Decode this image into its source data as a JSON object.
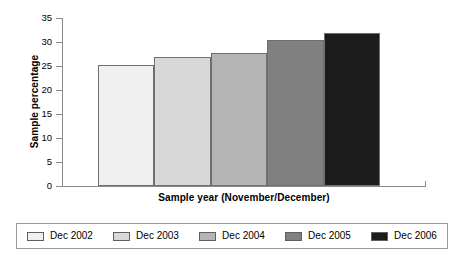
{
  "chart_data": {
    "type": "bar",
    "title": "",
    "xlabel": "Sample year (November/December)",
    "ylabel": "Sample percentage",
    "categories": [
      "Dec 2002",
      "Dec 2003",
      "Dec 2004",
      "Dec 2005",
      "Dec 2006"
    ],
    "values": [
      25.3,
      26.8,
      27.7,
      30.4,
      31.8
    ],
    "ylim": [
      0,
      35
    ],
    "yticks": [
      0,
      5,
      10,
      15,
      20,
      25,
      30,
      35
    ],
    "ytick_labels": [
      "0",
      "5",
      "10",
      "15",
      "20",
      "25",
      "30",
      "35"
    ],
    "xticks": [],
    "grid": false,
    "legend_position": "bottom",
    "bar_colors": [
      "#f0f0f0",
      "#d8d8d8",
      "#b5b5b5",
      "#808080",
      "#1c1c1c"
    ],
    "bar_border_color": "#6f6f6f"
  },
  "legend": {
    "items": [
      {
        "label": "Dec 2002",
        "color": "#f0f0f0"
      },
      {
        "label": "Dec 2003",
        "color": "#d8d8d8"
      },
      {
        "label": "Dec 2004",
        "color": "#b5b5b5"
      },
      {
        "label": "Dec 2005",
        "color": "#808080"
      },
      {
        "label": "Dec 2006",
        "color": "#1c1c1c"
      }
    ]
  }
}
